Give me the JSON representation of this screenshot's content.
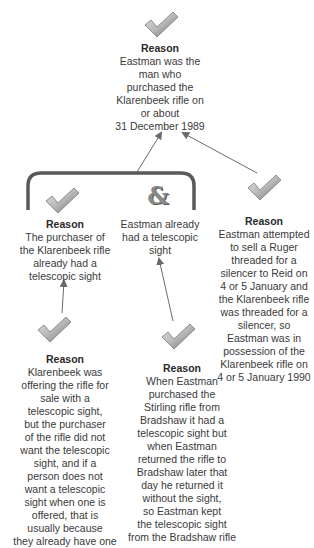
{
  "diagram": {
    "type": "argument-map",
    "colors": {
      "check_light": "#d4d4d4",
      "check_dark": "#6e6e6e",
      "bracket": "#5a5a5a",
      "arrow": "#6a6a6a",
      "text": "#3a3a3a"
    },
    "claim": {
      "icon": "check-icon",
      "title": "Reason",
      "text": "Eastman was the\nman who\npurchased the\nKlarenbeek rifle on\nor about\n31 December 1989"
    },
    "co_premise_group": {
      "connector_icon": "ampersand-icon",
      "connector_label": "&",
      "left": {
        "icon": "check-icon",
        "title": "Reason",
        "text": "The purchaser of\nthe Klarenbeek rifle\nalready had a\ntelescopic sight"
      },
      "right": {
        "text": "Eastman already\nhad a telescopic\nsight"
      }
    },
    "right_reason": {
      "icon": "check-icon",
      "title": "Reason",
      "text": "Eastman attempted\nto sell a Ruger\nthreaded for a\nsilencer to Reid on\n4 or 5 January and\nthe Klarenbeek rifle\nwas threaded for a\nsilencer, so\nEastman was in\npossession of the\nKlarenbeek rifle on\n4 or 5 January 1990"
    },
    "bottom_left_reason": {
      "icon": "check-icon",
      "title": "Reason",
      "text": "Klarenbeek was\noffering the rifle for\nsale with a\ntelescopic sight,\nbut the purchaser\nof the rifle did not\nwant the telescopic\nsight, and if a\nperson does not\nwant a telescopic\nsight when one is\noffered, that is\nusually because\nthey already have  one"
    },
    "bottom_center_reason": {
      "icon": "check-icon",
      "title": "Reason",
      "text": "When Eastman\npurchased the\nStirling rifle from\nBradshaw it had a\ntelescopic sight but\nwhen Eastman\nreturned the rifle to\nBradshaw later that\nday he returned it\nwithout the sight,\nso Eastman kept\nthe telescopic sight\nfrom the Bradshaw rifle"
    }
  }
}
